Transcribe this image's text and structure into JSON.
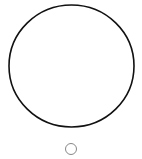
{
  "canvas": {
    "width": 142,
    "height": 159,
    "background": "#ffffff"
  },
  "shapes": {
    "large_circle": {
      "cx": 71.5,
      "cy": 66,
      "rx": 62.5,
      "ry": 61,
      "stroke": "#111111",
      "stroke_width": 1.6,
      "fill": "none"
    },
    "small_circle": {
      "cx": 71,
      "cy": 149,
      "r": 5.5,
      "stroke": "#888888",
      "stroke_width": 1,
      "fill": "none"
    }
  }
}
